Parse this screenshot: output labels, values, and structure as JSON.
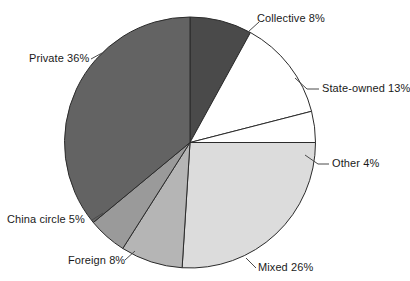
{
  "chart_data": {
    "type": "pie",
    "title": "",
    "subtitle": "",
    "xlabel": "",
    "ylabel": "",
    "legend_position": "none",
    "grid": false,
    "units": "percent",
    "start_angle_deg": 0,
    "direction": "clockwise",
    "categories": [
      "Collective",
      "State-owned",
      "Other",
      "Mixed",
      "Foreign",
      "China circle",
      "Private"
    ],
    "values": [
      8,
      13,
      4,
      26,
      8,
      5,
      36
    ],
    "labels": [
      "Collective 8%",
      "State-owned 13%",
      "Other 4%",
      "Mixed 26%",
      "Foreign 8%",
      "China circle 5%",
      "Private 36%"
    ],
    "colors": [
      "#4a4a4a",
      "#ffffff",
      "#ffffff",
      "#dcdcdc",
      "#b5b5b5",
      "#9a9a9a",
      "#636363"
    ],
    "slices": [
      {
        "name": "Collective",
        "value": 8,
        "label": "Collective 8%",
        "color": "#4a4a4a"
      },
      {
        "name": "State-owned",
        "value": 13,
        "label": "State-owned 13%",
        "color": "#ffffff"
      },
      {
        "name": "Other",
        "value": 4,
        "label": "Other 4%",
        "color": "#ffffff"
      },
      {
        "name": "Mixed",
        "value": 26,
        "label": "Mixed 26%",
        "color": "#dcdcdc"
      },
      {
        "name": "Foreign",
        "value": 8,
        "label": "Foreign 8%",
        "color": "#b5b5b5"
      },
      {
        "name": "China circle",
        "value": 5,
        "label": "China circle 5%",
        "color": "#9a9a9a"
      },
      {
        "name": "Private",
        "value": 36,
        "label": "Private 36%",
        "color": "#636363"
      }
    ]
  }
}
